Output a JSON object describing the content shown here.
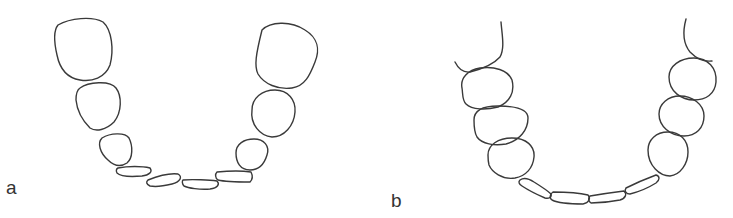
{
  "figure": {
    "panels": [
      {
        "label": "a",
        "description": "Dental arch with spaced teeth: three large posterior teeth each side and five small flattened anterior teeth"
      },
      {
        "label": "b",
        "description": "Dental arch with contacting rounded posterior teeth, gingival contour lines at top, and four elongated anterior teeth in a curved row"
      }
    ],
    "stroke_color": "#3a3a3a",
    "background": "#ffffff"
  }
}
